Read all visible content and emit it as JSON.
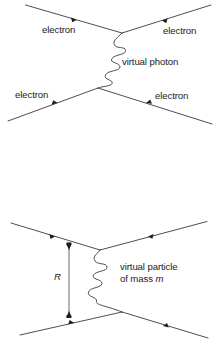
{
  "figure": {
    "diagrams": [
      {
        "name": "electron-electron-scattering-virtual-photon",
        "labels": {
          "in_left": "electron",
          "in_right": "electron",
          "out_left": "electron",
          "out_right": "electron",
          "exchange": "virtual photon"
        }
      },
      {
        "name": "range-of-force-virtual-particle",
        "labels": {
          "range": "R",
          "exchange_line1": "virtual particle",
          "exchange_line2_prefix": "of mass ",
          "exchange_line2_symbol": "m"
        }
      }
    ]
  },
  "colors": {
    "background": "#ffffff",
    "line": "#3a3a3a",
    "text": "#1b1b1b",
    "marker": "#1d1d1d",
    "range_line": "#55585b"
  }
}
